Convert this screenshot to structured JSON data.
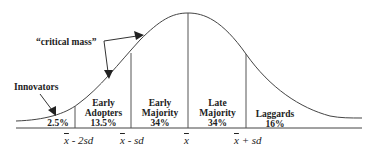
{
  "annotations": {
    "critical_mass": "“critical mass”",
    "innovators": "Innovators"
  },
  "segments": [
    {
      "name": "Innovators",
      "label": "",
      "percent": "2.5%"
    },
    {
      "name": "Early Adopters",
      "label_line1": "Early",
      "label_line2": "Adopters",
      "percent": "13.5%"
    },
    {
      "name": "Early Majority",
      "label_line1": "Early",
      "label_line2": "Majority",
      "percent": "34%"
    },
    {
      "name": "Late Majority",
      "label_line1": "Late",
      "label_line2": "Majority",
      "percent": "34%"
    },
    {
      "name": "Laggards",
      "label_line1": "Laggards",
      "percent": "16%"
    }
  ],
  "axis_labels": [
    {
      "mean": "x",
      "suffix": " - 2sd"
    },
    {
      "mean": "x",
      "suffix": " - sd"
    },
    {
      "mean": "x",
      "suffix": ""
    },
    {
      "mean": "x",
      "suffix": " + sd"
    }
  ],
  "colors": {
    "line": "#333333",
    "background": "#ffffff"
  }
}
